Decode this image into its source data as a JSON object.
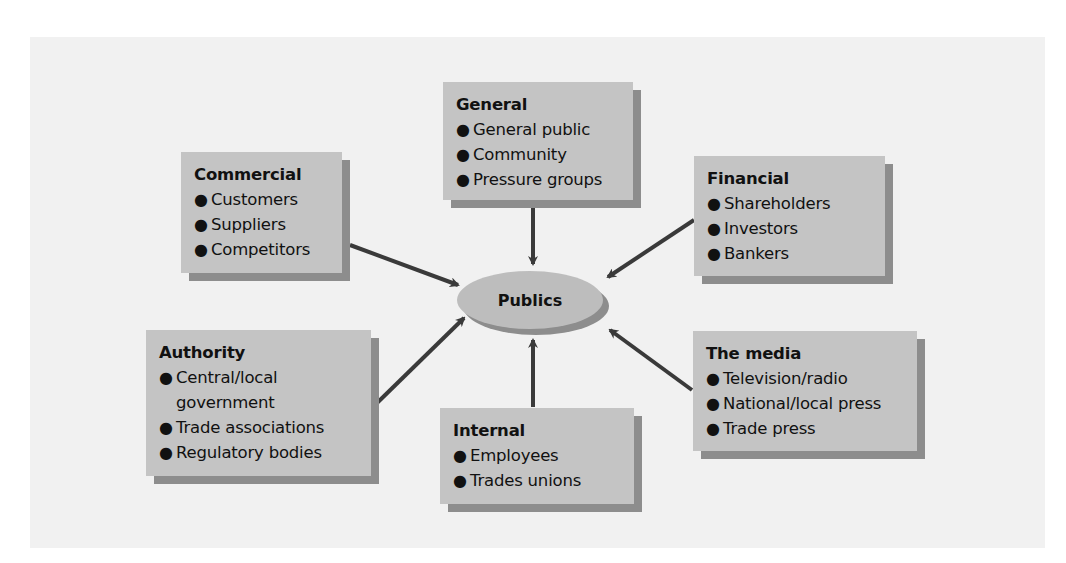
{
  "diagram": {
    "center": {
      "label": "Publics"
    },
    "colors": {
      "panel": "#f1f1f1",
      "box": "#c4c4c4",
      "shadow": "#8d8d8d",
      "arrow": "#3a3a3a"
    },
    "groups": [
      {
        "id": "general",
        "title": "General",
        "items": [
          "General public",
          "Community",
          "Pressure groups"
        ]
      },
      {
        "id": "commercial",
        "title": "Commercial",
        "items": [
          "Customers",
          "Suppliers",
          "Competitors"
        ]
      },
      {
        "id": "financial",
        "title": "Financial",
        "items": [
          "Shareholders",
          "Investors",
          "Bankers"
        ]
      },
      {
        "id": "authority",
        "title": "Authority",
        "items": [
          "Central/local\ngovernment",
          "Trade associations",
          "Regulatory bodies"
        ]
      },
      {
        "id": "internal",
        "title": "Internal",
        "items": [
          "Employees",
          "Trades unions"
        ]
      },
      {
        "id": "media",
        "title": "The media",
        "items": [
          "Television/radio",
          "National/local press",
          "Trade press"
        ]
      }
    ],
    "bullet": "●"
  }
}
